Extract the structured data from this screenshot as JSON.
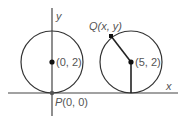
{
  "diagram": {
    "axes": {
      "x_label": "x",
      "y_label": "y"
    },
    "left_circle": {
      "center_label": "(0, 2)",
      "tangent_point_label_prefix": "P",
      "tangent_point_label_coords": "(0, 0)"
    },
    "right_circle": {
      "center_label": "(5, 2)",
      "point_label_prefix": "Q",
      "point_label_coords": "(x, y)"
    },
    "colors": {
      "stroke": "#333333",
      "text": "#555555"
    }
  }
}
